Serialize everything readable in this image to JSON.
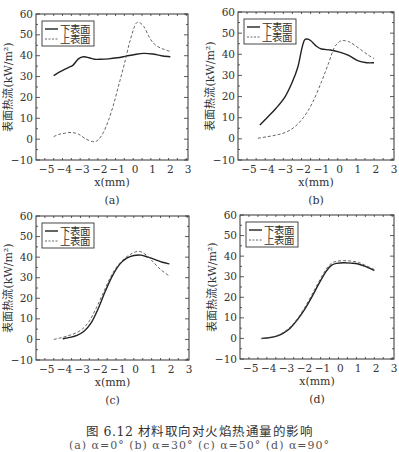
{
  "figure": {
    "caption": "图 6.12   材料取向对火焰热通量的影响",
    "caption_sub": "(a) α=0°  (b) α=30°  (c) α=50°  (d) α=90°"
  },
  "chart_data": [
    {
      "id": "a",
      "type": "line",
      "panel_label": "(a)",
      "title": "",
      "xlabel": "x(mm)",
      "ylabel": "表面热流(kW/m²)",
      "xlim": [
        -5.6,
        3
      ],
      "ylim": [
        -10,
        60
      ],
      "xticks": [
        -5,
        -4,
        -3,
        -2,
        -1,
        0,
        1,
        2,
        3
      ],
      "yticks": [
        -10,
        0,
        10,
        20,
        30,
        40,
        50,
        60
      ],
      "grid": false,
      "legend": {
        "position": "upper-left",
        "entries": [
          "下表面",
          "上表面"
        ]
      },
      "frame": {
        "left": 36,
        "top": 14,
        "right": 188,
        "bottom": 160
      },
      "series": [
        {
          "name": "下表面",
          "style": "solid",
          "x": [
            -4.6,
            -4.2,
            -3.8,
            -3.5,
            -3.2,
            -2.9,
            -2.6,
            -2.3,
            -2.0,
            -1.5,
            -1.0,
            -0.5,
            0.0,
            0.5,
            1.0,
            1.5,
            2.0
          ],
          "y": [
            30.5,
            32.5,
            34.2,
            35.5,
            38.5,
            39.5,
            39.0,
            38.3,
            38.3,
            38.5,
            39.0,
            39.8,
            40.6,
            41.1,
            40.8,
            40.0,
            39.5
          ]
        },
        {
          "name": "上表面",
          "style": "dashed",
          "x": [
            -4.6,
            -4.3,
            -4.0,
            -3.6,
            -3.2,
            -2.8,
            -2.4,
            -2.1,
            -1.8,
            -1.5,
            -1.2,
            -0.9,
            -0.6,
            -0.3,
            0.0,
            0.2,
            0.5,
            0.8,
            1.1,
            1.5,
            2.0
          ],
          "y": [
            1.2,
            2.3,
            2.8,
            3.2,
            2.4,
            0.2,
            -1.2,
            -0.5,
            3.0,
            9.0,
            17.0,
            26.5,
            36.0,
            46.5,
            54.5,
            56.0,
            54.0,
            49.0,
            45.5,
            43.5,
            42.0
          ]
        }
      ]
    },
    {
      "id": "b",
      "type": "line",
      "panel_label": "(b)",
      "title": "",
      "xlabel": "x(mm)",
      "ylabel": "表面热流(kW/m²)",
      "xlim": [
        -5.6,
        3
      ],
      "ylim": [
        -10,
        60
      ],
      "xticks": [
        -5,
        -4,
        -3,
        -2,
        -1,
        0,
        1,
        2,
        3
      ],
      "yticks": [
        -10,
        0,
        10,
        20,
        30,
        40,
        50,
        60
      ],
      "grid": false,
      "legend": {
        "position": "upper-left",
        "entries": [
          "下表面",
          "上表面"
        ]
      },
      "frame": {
        "left": 238,
        "top": 12,
        "right": 394,
        "bottom": 160
      },
      "series": [
        {
          "name": "下表面",
          "style": "solid",
          "x": [
            -4.4,
            -4.0,
            -3.5,
            -3.0,
            -2.6,
            -2.3,
            -2.1,
            -1.95,
            -1.8,
            -1.6,
            -1.3,
            -1.0,
            -0.5,
            0.0,
            0.5,
            1.0,
            1.5,
            1.9
          ],
          "y": [
            6.5,
            10.0,
            14.5,
            20.0,
            27.0,
            34.0,
            42.0,
            46.5,
            47.2,
            46.5,
            44.0,
            42.5,
            42.0,
            41.0,
            39.5,
            37.0,
            36.0,
            36.0
          ]
        },
        {
          "name": "上表面",
          "style": "dashed",
          "x": [
            -4.5,
            -4.0,
            -3.5,
            -3.0,
            -2.5,
            -2.0,
            -1.5,
            -1.0,
            -0.6,
            -0.3,
            0.0,
            0.2,
            0.5,
            0.8,
            1.2,
            1.6,
            1.9
          ],
          "y": [
            0.3,
            1.0,
            1.8,
            3.0,
            5.5,
            10.0,
            17.0,
            27.0,
            36.0,
            43.0,
            46.0,
            46.5,
            46.0,
            44.5,
            42.0,
            39.5,
            38.0
          ]
        }
      ]
    },
    {
      "id": "c",
      "type": "line",
      "panel_label": "(c)",
      "title": "",
      "xlabel": "x(mm)",
      "ylabel": "表面热流(kW/m²)",
      "xlim": [
        -5.6,
        3
      ],
      "ylim": [
        -10,
        60
      ],
      "xticks": [
        -5,
        -4,
        -3,
        -2,
        -1,
        0,
        1,
        2,
        3
      ],
      "yticks": [
        -10,
        0,
        10,
        20,
        30,
        40,
        50,
        60
      ],
      "grid": false,
      "legend": {
        "position": "upper-left",
        "entries": [
          "下表面",
          "上表面"
        ]
      },
      "frame": {
        "left": 36,
        "top": 216,
        "right": 189,
        "bottom": 360
      },
      "series": [
        {
          "name": "下表面",
          "style": "solid",
          "x": [
            -4.1,
            -3.7,
            -3.3,
            -2.9,
            -2.5,
            -2.1,
            -1.7,
            -1.3,
            -0.9,
            -0.5,
            -0.1,
            0.3,
            0.7,
            1.1,
            1.5,
            1.9
          ],
          "y": [
            0.3,
            1.0,
            2.0,
            4.0,
            8.0,
            15.0,
            23.5,
            31.0,
            36.5,
            39.5,
            40.8,
            41.0,
            40.0,
            38.8,
            37.5,
            36.7
          ]
        },
        {
          "name": "上表面",
          "style": "dashed",
          "x": [
            -4.6,
            -4.2,
            -3.8,
            -3.4,
            -3.0,
            -2.6,
            -2.2,
            -1.8,
            -1.4,
            -1.0,
            -0.6,
            -0.2,
            0.2,
            0.6,
            1.0,
            1.4,
            1.9
          ],
          "y": [
            0.0,
            0.8,
            1.8,
            3.0,
            5.0,
            9.0,
            15.5,
            23.0,
            30.5,
            36.0,
            39.5,
            41.8,
            42.8,
            41.0,
            37.5,
            34.0,
            30.8
          ]
        }
      ]
    },
    {
      "id": "d",
      "type": "line",
      "panel_label": "(d)",
      "title": "",
      "xlabel": "x(mm)",
      "ylabel": "表面热流(kW/m²)",
      "xlim": [
        -5.6,
        3
      ],
      "ylim": [
        -10,
        60
      ],
      "xticks": [
        -5,
        -4,
        -3,
        -2,
        -1,
        0,
        1,
        2,
        3
      ],
      "yticks": [
        -10,
        0,
        10,
        20,
        30,
        40,
        50,
        60
      ],
      "grid": false,
      "legend": {
        "position": "upper-left",
        "entries": [
          "下表面",
          "上表面"
        ]
      },
      "frame": {
        "left": 240,
        "top": 215,
        "right": 394,
        "bottom": 359
      },
      "series": [
        {
          "name": "下表面",
          "style": "solid",
          "x": [
            -4.4,
            -4.0,
            -3.6,
            -3.2,
            -2.8,
            -2.4,
            -2.0,
            -1.6,
            -1.2,
            -0.8,
            -0.5,
            -0.2,
            0.2,
            0.6,
            1.0,
            1.4,
            1.9
          ],
          "y": [
            0.0,
            0.3,
            1.0,
            2.5,
            5.0,
            9.0,
            14.0,
            20.0,
            26.5,
            32.5,
            35.5,
            36.5,
            36.8,
            36.6,
            36.2,
            35.0,
            33.0
          ]
        },
        {
          "name": "上表面",
          "style": "dashed",
          "x": [
            -4.4,
            -4.0,
            -3.6,
            -3.2,
            -2.8,
            -2.4,
            -2.0,
            -1.6,
            -1.2,
            -0.8,
            -0.5,
            -0.2,
            0.2,
            0.6,
            1.0,
            1.4,
            1.9
          ],
          "y": [
            0.0,
            0.4,
            1.2,
            2.8,
            5.5,
            9.5,
            14.8,
            21.0,
            27.5,
            33.5,
            36.5,
            37.5,
            37.8,
            37.6,
            37.0,
            35.5,
            33.5
          ]
        }
      ]
    }
  ],
  "style": {
    "axis_color": "#333333",
    "solid_color": "#222222",
    "dashed_color": "#555555",
    "text_color": "#333333"
  }
}
